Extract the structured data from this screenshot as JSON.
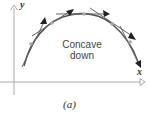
{
  "figure": {
    "y_axis_label": "y",
    "x_axis_label": "x",
    "annotation": {
      "line1": "Concave",
      "line2": "down"
    },
    "caption": "(a)",
    "colors": {
      "curve": "#555555",
      "tangent": "#666666",
      "arrowhead": "#222222",
      "point": "#aaaaaa",
      "axis": "#aaaaaa"
    }
  }
}
